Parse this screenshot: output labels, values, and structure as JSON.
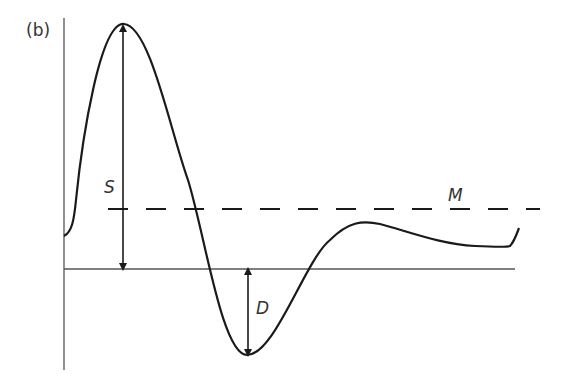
{
  "panel_label": "(b)",
  "labels": {
    "S": "S",
    "D": "D",
    "M": "M"
  },
  "colors": {
    "stroke": "#1a1a1a",
    "axis": "#555555",
    "text": "#333333"
  }
}
